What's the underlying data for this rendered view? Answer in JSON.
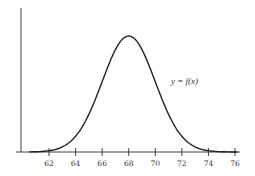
{
  "chart_data": {
    "type": "line",
    "title": "",
    "xlabel": "",
    "ylabel": "",
    "annotation": "y = f(x)",
    "x_ticks": [
      62,
      64,
      66,
      68,
      70,
      72,
      74,
      76
    ],
    "x_range": [
      60,
      76.5
    ],
    "grid": false,
    "legend": "none",
    "series": [
      {
        "name": "y = f(x)",
        "description": "normal (bell-shaped) curve centered at 68, sd approx 2",
        "mean": 68,
        "sd": 2,
        "x": [
          60,
          61,
          62,
          63,
          64,
          65,
          66,
          67,
          68,
          69,
          70,
          71,
          72,
          73,
          74,
          75,
          76
        ],
        "values": [
          0.0001,
          0.0009,
          0.0044,
          0.0175,
          0.054,
          0.1295,
          0.242,
          0.3521,
          0.3989,
          0.3521,
          0.242,
          0.1295,
          0.054,
          0.0175,
          0.0044,
          0.0009,
          0.0001
        ]
      }
    ]
  },
  "labels": {
    "function": "y = f(x)",
    "ticks": [
      "62",
      "64",
      "66",
      "68",
      "70",
      "72",
      "74",
      "76"
    ]
  }
}
